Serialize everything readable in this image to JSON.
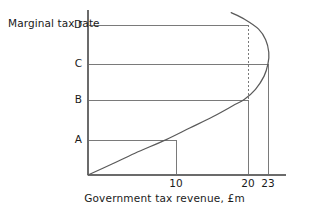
{
  "chart_data": {
    "type": "line",
    "title": "",
    "xlabel": "Government tax revenue, £m",
    "ylabel": "Marginal tax rate",
    "xlim": [
      0,
      26
    ],
    "ylim": [
      0,
      1
    ],
    "grid": false,
    "legend": null,
    "curve_name": "Laffer curve",
    "x_ticks": [
      {
        "label": "10",
        "value": 10
      },
      {
        "label": "20",
        "value": 20
      },
      {
        "label": "23",
        "value": 23
      }
    ],
    "y_ticks": [
      {
        "label": "A",
        "value": 0.215
      },
      {
        "label": "B",
        "value": 0.46
      },
      {
        "label": "C",
        "value": 0.675
      },
      {
        "label": "D",
        "value": 0.91
      }
    ],
    "series": [
      {
        "name": "Laffer curve",
        "points": [
          {
            "x": 0.0,
            "y": 0.0
          },
          {
            "x": 3.0,
            "y": 0.065
          },
          {
            "x": 6.0,
            "y": 0.132
          },
          {
            "x": 10.0,
            "y": 0.215
          },
          {
            "x": 13.0,
            "y": 0.285
          },
          {
            "x": 16.0,
            "y": 0.355
          },
          {
            "x": 18.5,
            "y": 0.42
          },
          {
            "x": 20.0,
            "y": 0.46
          },
          {
            "x": 21.4,
            "y": 0.52
          },
          {
            "x": 22.5,
            "y": 0.6
          },
          {
            "x": 23.0,
            "y": 0.675
          },
          {
            "x": 23.1,
            "y": 0.745
          },
          {
            "x": 22.7,
            "y": 0.82
          },
          {
            "x": 21.8,
            "y": 0.885
          },
          {
            "x": 20.0,
            "y": 0.945
          },
          {
            "x": 18.3,
            "y": 0.985
          }
        ]
      }
    ],
    "reference_lines": [
      {
        "name": "A",
        "type": "horizontal",
        "level": "A",
        "to_x": 10,
        "style": "solid"
      },
      {
        "name": "B",
        "type": "horizontal",
        "level": "B",
        "to_x": 20,
        "style": "solid"
      },
      {
        "name": "C",
        "type": "horizontal",
        "level": "C",
        "to_x": 23,
        "style": "solid"
      },
      {
        "name": "D",
        "type": "horizontal",
        "level": "D",
        "to_x": 20,
        "style": "solid"
      },
      {
        "name": "x10",
        "type": "vertical",
        "at_x": 10,
        "from_level": "A",
        "style": "solid"
      },
      {
        "name": "x20-lower",
        "type": "vertical",
        "at_x": 20,
        "from_level": "B",
        "style": "solid"
      },
      {
        "name": "x20-upper",
        "type": "vertical",
        "at_x": 20,
        "from_level": "D",
        "style": "dashed"
      },
      {
        "name": "x23",
        "type": "vertical",
        "at_x": 23,
        "from_level": "C",
        "style": "solid"
      }
    ],
    "colors": {
      "axis": "#6b6b6b",
      "curve": "#5a5a5a",
      "reference": "#7a7a7a",
      "text": "#1a1a1a",
      "background": "#ffffff"
    }
  }
}
